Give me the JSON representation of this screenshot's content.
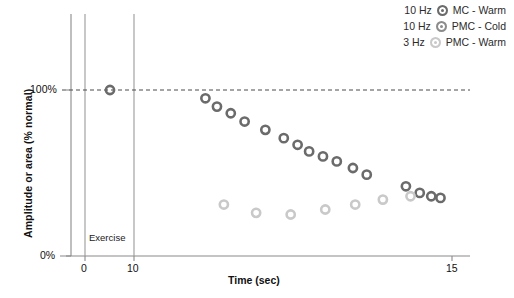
{
  "chart_data": {
    "type": "scatter",
    "title": "",
    "xlabel": "Time (sec)",
    "ylabel": "Amplitude or area (% normal)",
    "xlim": [
      -1.2,
      16.0
    ],
    "ylim": [
      0,
      118
    ],
    "grid": false,
    "legend_position": "top-right",
    "xticks": [
      0,
      10,
      15
    ],
    "xtick_labels": [
      "0",
      "10",
      "15"
    ],
    "yticks": [
      0,
      100
    ],
    "ytick_labels": [
      "0%",
      "100%"
    ],
    "reference_line": {
      "label": "100% normal",
      "y": 100,
      "style": "dashed"
    },
    "annotations": [
      {
        "name": "exercise-span",
        "text": "Exercise",
        "x_start": 0,
        "x_end": 10
      }
    ],
    "series": [
      {
        "name": "MC - Warm",
        "frequency": "10 Hz",
        "color": "#6b6b6b",
        "marker": "circle",
        "points": [
          {
            "x": 5.1,
            "y": 100
          },
          {
            "x": 13.1,
            "y": 95
          },
          {
            "x": 13.6,
            "y": 90
          },
          {
            "x": 14.2,
            "y": 86
          },
          {
            "x": 14.8,
            "y": 81
          },
          {
            "x": 15.7,
            "y": 76
          },
          {
            "x": 16.5,
            "y": 71
          },
          {
            "x": 17.1,
            "y": 67
          },
          {
            "x": 17.6,
            "y": 63
          },
          {
            "x": 18.2,
            "y": 60
          },
          {
            "x": 18.8,
            "y": 57
          },
          {
            "x": 19.5,
            "y": 53
          },
          {
            "x": 20.1,
            "y": 49
          },
          {
            "x": 21.8,
            "y": 42
          },
          {
            "x": 22.4,
            "y": 38
          },
          {
            "x": 22.9,
            "y": 36
          },
          {
            "x": 23.3,
            "y": 35
          }
        ]
      },
      {
        "name": "PMC - Cold",
        "frequency": "10 Hz",
        "color": "#8c8c8c",
        "marker": "circle",
        "points": []
      },
      {
        "name": "PMC - Warm",
        "frequency": "3 Hz",
        "color": "#c9c9c9",
        "marker": "circle",
        "points": [
          {
            "x": 13.9,
            "y": 31
          },
          {
            "x": 15.3,
            "y": 26
          },
          {
            "x": 16.8,
            "y": 25
          },
          {
            "x": 18.3,
            "y": 28
          },
          {
            "x": 19.6,
            "y": 31
          },
          {
            "x": 20.8,
            "y": 34
          },
          {
            "x": 22.0,
            "y": 36
          }
        ]
      }
    ]
  },
  "legend": {
    "items": [
      {
        "freq": "10 Hz",
        "label": "MC - Warm",
        "color": "#6b6b6b"
      },
      {
        "freq": "10 Hz",
        "label": "PMC - Cold",
        "color": "#8c8c8c"
      },
      {
        "freq": "3 Hz",
        "label": "PMC - Warm",
        "color": "#c9c9c9"
      }
    ]
  },
  "axes": {
    "y_title": "Amplitude or area (% normal)",
    "x_title": "Time (sec)",
    "y_tick_top": "100%",
    "y_tick_bottom": "0%",
    "x_tick_0": "0",
    "x_tick_10": "10",
    "x_tick_15": "15",
    "exercise_label": "Exercise"
  },
  "colors": {
    "axis": "#8a8a8a",
    "text": "#111111",
    "marker_dark": "#6b6b6b",
    "marker_mid": "#8c8c8c",
    "marker_light": "#c9c9c9",
    "background": "#ffffff"
  }
}
